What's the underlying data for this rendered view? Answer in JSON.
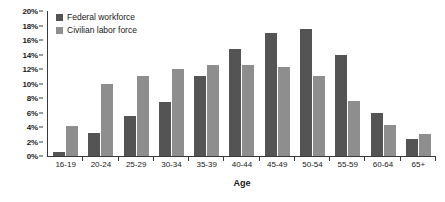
{
  "chart_data": {
    "type": "bar",
    "title": "",
    "xlabel": "Age",
    "ylabel": "",
    "ylim": [
      0,
      20
    ],
    "ytick_labels": [
      "20%",
      "18%",
      "16%",
      "14%",
      "12%",
      "10%",
      "8%",
      "6%",
      "4%",
      "2%",
      "0%"
    ],
    "ytick_values": [
      20,
      18,
      16,
      14,
      12,
      10,
      8,
      6,
      4,
      2,
      0
    ],
    "grid": false,
    "legend_position": "top-left",
    "categories": [
      "16-19",
      "20-24",
      "25-29",
      "30-34",
      "35-39",
      "40-44",
      "45-49",
      "50-54",
      "55-59",
      "60-64",
      "65+"
    ],
    "series": [
      {
        "name": "Federal workforce",
        "color": "#545454",
        "values": [
          0.6,
          3.2,
          5.5,
          7.5,
          11.0,
          14.8,
          17.0,
          17.5,
          14.0,
          6.0,
          2.4
        ]
      },
      {
        "name": "Civilian labor force",
        "color": "#8e8e8e",
        "values": [
          4.2,
          10.0,
          11.0,
          12.0,
          12.5,
          12.6,
          12.3,
          11.0,
          7.6,
          4.3,
          3.1
        ]
      }
    ]
  }
}
